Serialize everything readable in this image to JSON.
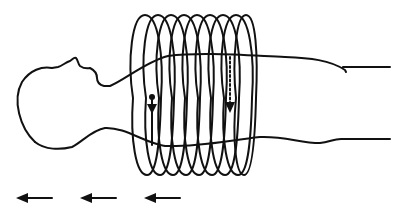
{
  "diagram": {
    "caption": "",
    "stroke_color": "#111111",
    "background": "#ffffff",
    "body": {
      "label": "human body outline (supine, head left)"
    },
    "coil": {
      "label": "solenoid coil",
      "turns": 9,
      "x_start": 128,
      "x_end": 246,
      "top_y": 15,
      "bottom_y": 175
    },
    "markers": {
      "solid_arrow": {
        "label": "solid downward arrow with dot",
        "x": 152,
        "y_start": 97,
        "y_end": 112
      },
      "dotted_arrow": {
        "label": "dotted downward arrow",
        "x": 230,
        "y_start": 57,
        "y_end": 112
      }
    },
    "direction_arrows": [
      {
        "label": "left arrow 1",
        "x_start": 52,
        "x_end": 17,
        "y": 198
      },
      {
        "label": "left arrow 2",
        "x_start": 116,
        "x_end": 80,
        "y": 198
      },
      {
        "label": "left arrow 3",
        "x_start": 180,
        "x_end": 144,
        "y": 198
      }
    ]
  }
}
